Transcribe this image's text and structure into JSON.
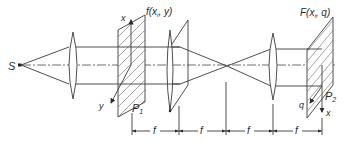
{
  "diagram": {
    "type": "optical-system",
    "source": {
      "label": "S"
    },
    "input_plane": {
      "label": "P",
      "label_sub": "1",
      "function_label": "f(x",
      "function_label_sub": "i",
      "function_label_end": ", y)",
      "axis_x": "x",
      "axis_y": "y"
    },
    "output_plane": {
      "label": "P",
      "label_sub": "2",
      "function_label": "F(x",
      "function_label_sub": "i",
      "function_label_end": ", q)",
      "axis_q": "q",
      "axis_x": "x"
    },
    "dimensions": [
      {
        "label": "f"
      },
      {
        "label": "f"
      },
      {
        "label": "f"
      },
      {
        "label": "f"
      }
    ],
    "colors": {
      "line": "#3a3a3a",
      "background": "#ffffff"
    }
  }
}
